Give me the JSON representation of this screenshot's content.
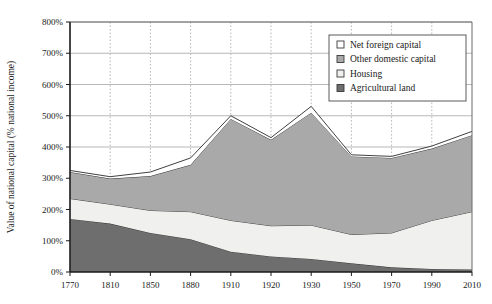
{
  "chart_data": {
    "type": "area",
    "stacked": true,
    "title": "",
    "subtitle": "",
    "xlabel": "",
    "ylabel": "Value of national capital (% national income)",
    "categories": [
      "1770",
      "1810",
      "1850",
      "1880",
      "1910",
      "1920",
      "1930",
      "1950",
      "1970",
      "1990",
      "2010"
    ],
    "x_tick_labels": [
      "1770",
      "1810",
      "1850",
      "1880",
      "1910",
      "1920",
      "1930",
      "1950",
      "1970",
      "1990",
      "2010"
    ],
    "y_tick_labels": [
      "0%",
      "100%",
      "200%",
      "300%",
      "400%",
      "500%",
      "600%",
      "700%",
      "800%"
    ],
    "y_tick_values": [
      0,
      100,
      200,
      300,
      400,
      500,
      600,
      700,
      800
    ],
    "ylim": [
      0,
      800
    ],
    "grid": {
      "horizontal": true,
      "vertical": true,
      "vertical_style": "dotted",
      "horizontal_style": "solid"
    },
    "legend": {
      "position": "top-right",
      "entries": [
        {
          "label": "Net foreign capital",
          "color": "#ffffff"
        },
        {
          "label": "Other domestic capital",
          "color": "#a9a9a9"
        },
        {
          "label": "Housing",
          "color": "#f0f0ee"
        },
        {
          "label": "Agricultural land",
          "color": "#6e6e6e"
        }
      ]
    },
    "series": [
      {
        "name": "Agricultural land",
        "color": "#6e6e6e",
        "values": [
          170,
          155,
          125,
          105,
          65,
          50,
          42,
          28,
          15,
          10,
          8
        ]
      },
      {
        "name": "Housing",
        "color": "#f0f0ee",
        "values": [
          65,
          62,
          72,
          88,
          100,
          98,
          108,
          92,
          110,
          155,
          185
        ]
      },
      {
        "name": "Other domestic capital",
        "color": "#a9a9a9",
        "values": [
          85,
          82,
          110,
          150,
          325,
          275,
          360,
          250,
          240,
          230,
          245
        ]
      },
      {
        "name": "Net foreign capital",
        "color": "#ffffff",
        "values": [
          5,
          6,
          13,
          22,
          10,
          7,
          20,
          5,
          5,
          8,
          12
        ]
      }
    ],
    "series_totals": [
      325,
      305,
      320,
      365,
      500,
      430,
      530,
      375,
      370,
      403,
      450
    ]
  },
  "plot_geometry": {
    "left": 70,
    "right": 472,
    "top": 22,
    "bottom": 272
  }
}
